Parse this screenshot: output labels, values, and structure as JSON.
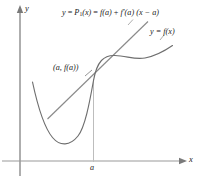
{
  "figure": {
    "type": "calculus-linearization-diagram",
    "background_color": "#ffffff",
    "axes": {
      "x_axis_label": "x",
      "y_axis_label": "y",
      "axis_color": "#8c8c8c",
      "x_axis_y_pixel": 161,
      "y_axis_x_pixel": 20,
      "tick_label": "a",
      "tick_x_pixel": 93
    },
    "labels": {
      "tangent_line_equation": "y = P₁(x) = f(a) + f′(a) (x − a)",
      "tangent_equation_parts": {
        "lhs": "y",
        "eq1": "=",
        "p_symbol": "P",
        "p_subscript": "1",
        "p_arg": "(x)",
        "eq2": "=",
        "term1": "f(a)",
        "plus": "+",
        "term2": "f′(a)",
        "term3": "(x − a)"
      },
      "curve_equation": "y = f(x)",
      "point_label": "(a, f(a))",
      "tick_label_a": "a",
      "y_axis_name": "y",
      "x_axis_name": "x"
    },
    "curves": [
      {
        "name": "function-curve",
        "label": "y = f(x)",
        "color": "#6e6e6e",
        "description": "Cubic-like curve: descends from upper-left, reaches a local minimum, rises through the tangency point, flattens at an inflection, then rises again to the right."
      },
      {
        "name": "tangent-line",
        "label": "y = P1(x)",
        "color": "#8a8a8a",
        "description": "Straight tangent line touching the curve at the point (a, f(a))."
      },
      {
        "name": "vertical-drop-line",
        "color": "#b0b0b0",
        "description": "Thin vertical line from the tangency point down to the x-axis at x = a."
      }
    ],
    "annotation_colors": {
      "text": "#1a1a1a",
      "axis": "#8c8c8c",
      "curve": "#6e6e6e",
      "tangent": "#8a8a8a",
      "drop_line": "#b0b0b0"
    }
  }
}
